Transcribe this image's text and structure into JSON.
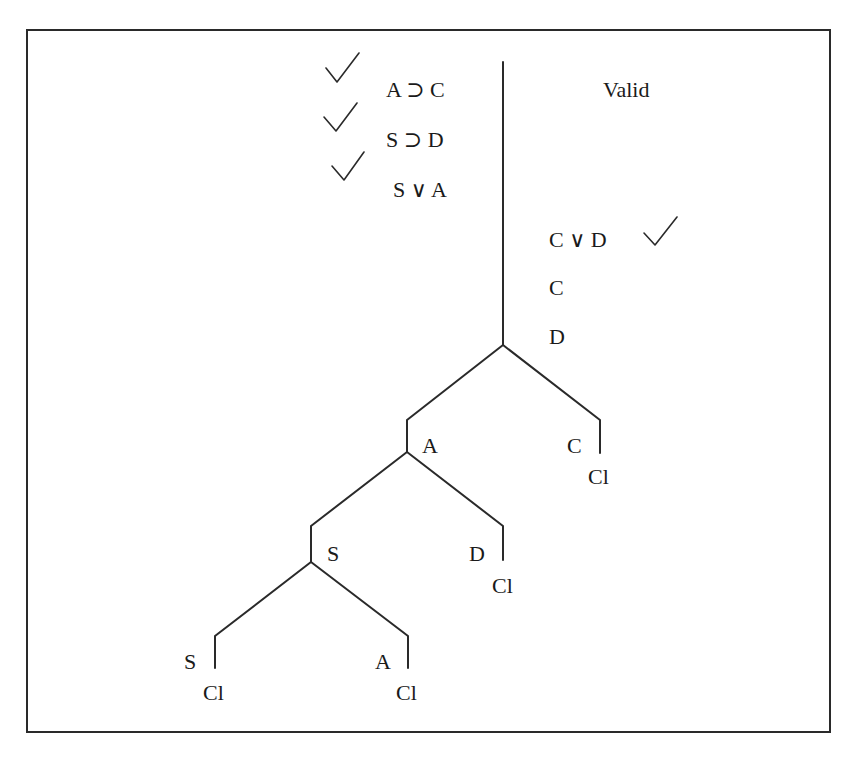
{
  "title": "Valid",
  "premises": [
    {
      "formula": "A ⊃ C",
      "checked": true
    },
    {
      "formula": "S ⊃ D",
      "checked": true
    },
    {
      "formula": "S ∨ A",
      "checked": true
    }
  ],
  "right_column": [
    {
      "formula": "C ∨ D",
      "checked": true
    },
    {
      "formula": "C",
      "checked": false
    },
    {
      "formula": "D",
      "checked": false
    }
  ],
  "branches": {
    "level1": {
      "left": "A",
      "right": "C",
      "right_status": "Cl"
    },
    "level2": {
      "left": "S",
      "right": "D",
      "right_status": "Cl"
    },
    "level3": {
      "left": "S",
      "left_status": "Cl",
      "right": "A",
      "right_status": "Cl"
    }
  },
  "icons": {
    "check": "check-mark-icon"
  },
  "colors": {
    "line": "#2a2a2a",
    "text": "#1a1a1a",
    "background": "#ffffff"
  }
}
